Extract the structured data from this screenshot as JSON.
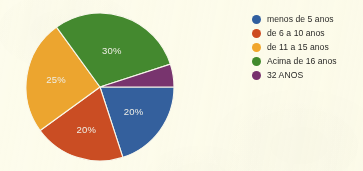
{
  "page": {
    "background_color": "#fdfcee"
  },
  "chart_data": {
    "type": "pie",
    "title": "",
    "subtitle": "",
    "xlabel": "",
    "ylabel": "",
    "grid": false,
    "legend_position": "right",
    "categories": [
      "menos de 5 anos",
      "de 6 a 10 anos",
      "de 11 a 15 anos",
      "Acima de 16 anos",
      "32 ANOS"
    ],
    "values": [
      20,
      20,
      25,
      30,
      5
    ],
    "value_unit": "%",
    "slice_labels": [
      "20%",
      "20%",
      "25%",
      "30%",
      ""
    ],
    "colors": [
      "#2e5fa3",
      "#d4491b",
      "#f5a623",
      "#3e8b27",
      "#7b3070"
    ],
    "slices": [
      {
        "label": "menos de 5 anos",
        "value": 20,
        "display": "20%",
        "color": "#2e5fa3"
      },
      {
        "label": "de 6 a 10 anos",
        "value": 20,
        "display": "20%",
        "color": "#d4491b"
      },
      {
        "label": "de 11 a 15 anos",
        "value": 25,
        "display": "25%",
        "color": "#f5a623"
      },
      {
        "label": "Acima de 16 anos",
        "value": 30,
        "display": "30%",
        "color": "#3e8b27"
      },
      {
        "label": "32 ANOS",
        "value": 5,
        "display": "",
        "color": "#7b3070"
      }
    ]
  },
  "legend": {
    "items": [
      {
        "label": "menos de 5 anos",
        "color": "#2e5fa3",
        "icon": "circle-swatch-icon"
      },
      {
        "label": "de 6 a 10 anos",
        "color": "#d4491b",
        "icon": "circle-swatch-icon"
      },
      {
        "label": "de 11 a 15 anos",
        "color": "#f5a623",
        "icon": "circle-swatch-icon"
      },
      {
        "label": "Acima de 16 anos",
        "color": "#3e8b27",
        "icon": "circle-swatch-icon"
      },
      {
        "label": "32 ANOS",
        "color": "#7b3070",
        "icon": "circle-swatch-icon"
      }
    ]
  }
}
